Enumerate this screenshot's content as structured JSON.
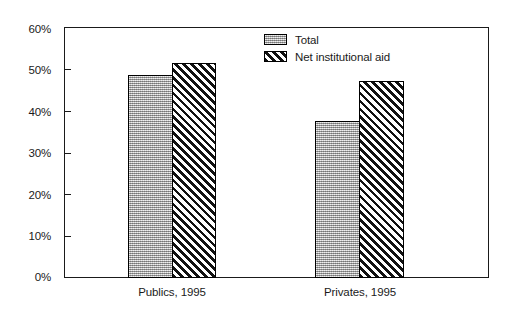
{
  "chart_data": {
    "type": "bar",
    "title": "",
    "subtitle": "",
    "xlabel": "",
    "ylabel": "",
    "categories": [
      "Publics, 1995",
      "Privates, 1995"
    ],
    "series": [
      {
        "name": "Total",
        "values": [
          48.5,
          37.5
        ],
        "swatch": "stipple-gray"
      },
      {
        "name": "Net institutional aid",
        "values": [
          51.5,
          47.0
        ],
        "swatch": "diagonal-hatch"
      }
    ],
    "ylim": [
      0,
      60
    ],
    "y_ticks": [
      {
        "value": 0,
        "label": "0%"
      },
      {
        "value": 10,
        "label": "10%"
      },
      {
        "value": 20,
        "label": "20%"
      },
      {
        "value": 30,
        "label": "30%"
      },
      {
        "value": 40,
        "label": "40%"
      },
      {
        "value": 50,
        "label": "50%"
      },
      {
        "value": 60,
        "label": "60%"
      }
    ],
    "grid": false,
    "legend_position": "top-center",
    "colors": {
      "axis": "#1a1a1a",
      "bar_total_fill": "#bdbdbd",
      "bar_aid_fill": "#ffffff",
      "bar_aid_hatch": "#111111",
      "background": "#ffffff"
    }
  }
}
